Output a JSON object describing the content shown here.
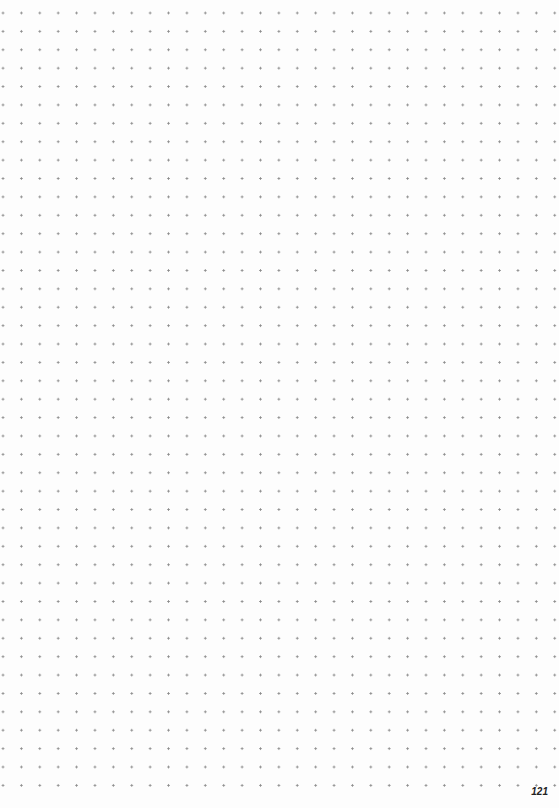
{
  "page": {
    "type": "dot-grid notebook page",
    "page_number": "121",
    "dot_color": "#8a8a8a",
    "background_color": "#fdfdfd"
  }
}
